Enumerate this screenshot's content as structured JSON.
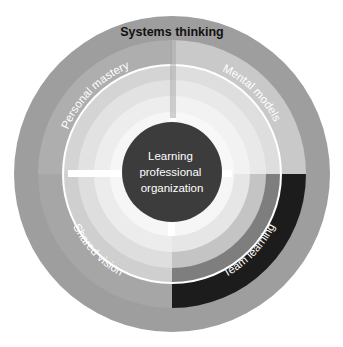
{
  "diagram": {
    "outer_ring_label": "Systems thinking",
    "center_label_lines": [
      "Learning",
      "professional",
      "organization"
    ],
    "quadrants": [
      {
        "position": "top-left",
        "label": "Personal mastery",
        "color": "#b0b0b0"
      },
      {
        "position": "top-right",
        "label": "Mental models",
        "color": "#c8c8c8"
      },
      {
        "position": "bottom-right",
        "label": "Team learning",
        "color": "#1a1a1a"
      },
      {
        "position": "bottom-left",
        "label": "Shared vision",
        "color": "#a8a8a8"
      }
    ],
    "colors": {
      "outer_ring": "#9e9e9e",
      "center_circle": "#3c3c3c",
      "background": "#ffffff"
    }
  }
}
